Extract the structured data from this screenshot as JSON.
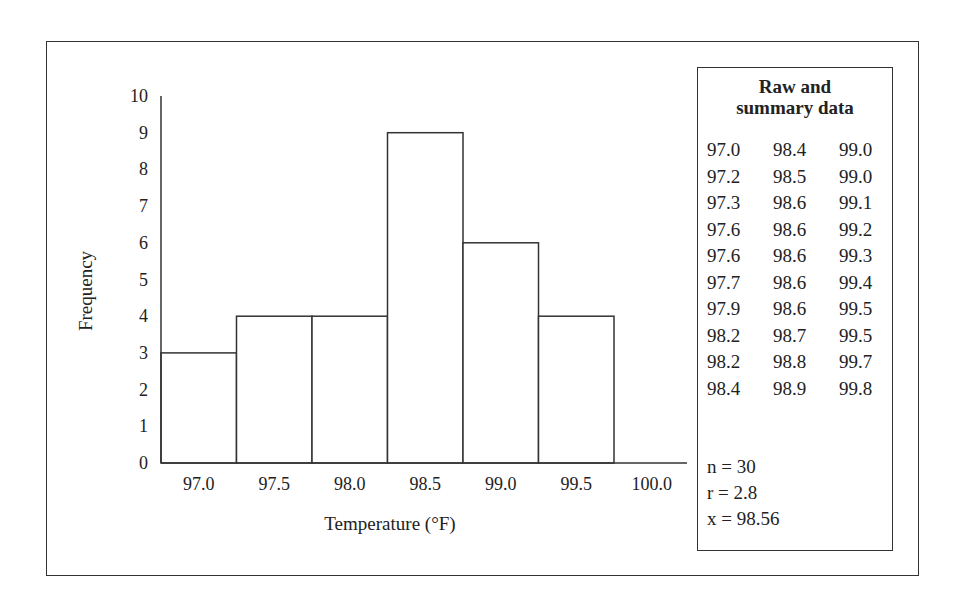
{
  "chart_data": {
    "type": "bar",
    "subtype": "histogram",
    "title": "",
    "xlabel": "Temperature (°F)",
    "ylabel": "Frequency",
    "ylim": [
      0,
      10
    ],
    "yticks": [
      0,
      1,
      2,
      3,
      4,
      5,
      6,
      7,
      8,
      9,
      10
    ],
    "xticks": [
      "97.0",
      "97.5",
      "98.0",
      "98.5",
      "99.0",
      "99.5",
      "100.0"
    ],
    "categories": [
      "97.0",
      "97.5",
      "98.0",
      "98.5",
      "99.0",
      "99.5",
      "100.0"
    ],
    "values": [
      3,
      4,
      4,
      9,
      6,
      4,
      0
    ],
    "grid": false,
    "legend": null
  },
  "side_panel": {
    "title_line1": "Raw and",
    "title_line2": "summary data",
    "raw_rows": [
      [
        "97.0",
        "98.4",
        "99.0"
      ],
      [
        "97.2",
        "98.5",
        "99.0"
      ],
      [
        "97.3",
        "98.6",
        "99.1"
      ],
      [
        "97.6",
        "98.6",
        "99.2"
      ],
      [
        "97.6",
        "98.6",
        "99.3"
      ],
      [
        "97.7",
        "98.6",
        "99.4"
      ],
      [
        "97.9",
        "98.6",
        "99.5"
      ],
      [
        "98.2",
        "98.7",
        "99.5"
      ],
      [
        "98.2",
        "98.8",
        "99.7"
      ],
      [
        "98.4",
        "98.9",
        "99.8"
      ]
    ],
    "stats": {
      "n": "n = 30",
      "r": "r = 2.8",
      "x": "x = 98.56"
    }
  }
}
